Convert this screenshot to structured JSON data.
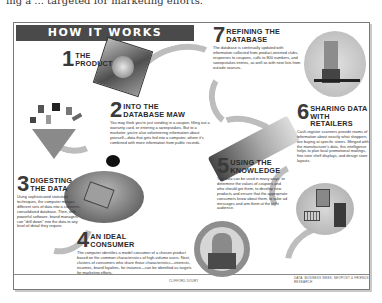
{
  "top_cutoff_text": "ing a ... targeted for marketing efforts.",
  "banner": {
    "title": "HOW IT WORKS"
  },
  "steps": [
    {
      "number": "1",
      "title_line1": "THE",
      "title_line2": "PRODUCT",
      "body": ""
    },
    {
      "number": "2",
      "title_line1": "INTO THE",
      "title_line2": "DATABASE MAW",
      "body": "You may think you're just sending in a coupon, filling out a warranty card, or entering a sweepstakes. But to a marketer, you're also volunteering information about yourself—data that gets fed into a computer, where it's combined with more information from public records."
    },
    {
      "number": "3",
      "title_line1": "DIGESTING",
      "title_line2": "THE DATA",
      "body": "Using sophisticated statistical techniques, the computer merges different sets of data into a coherent, consolidated database. Then, with powerful software, brand managers can \"drill down\" into the data to any level of detail they require."
    },
    {
      "number": "4",
      "title_line1": "AN IDEAL",
      "title_line2": "CONSUMER",
      "body": "The computer identifies a model consumer of a chosen product based on the common characteristics of high-volume users. Next, clusters of consumers who share those characteristics—interests, incomes, brand loyalties, for instance—can be identified as targets for marketing efforts."
    },
    {
      "number": "5",
      "title_line1": "USING THE",
      "title_line2": "KNOWLEDGE",
      "body": "The data can be used in many ways: to determine the values of coupons and who should get them, to develop new products and ensure that the appropriate consumers know about them, to tailor ad messages and aim them at the right audience."
    },
    {
      "number": "6",
      "title_line1": "SHARING DATA",
      "title_line2": "WITH RETAILERS",
      "body": "Cash-register scanners provide reams of information about exactly what shoppers are buying at specific stores. Merged with the manufacturer's data, this intelligence helps to plan local promotional mailings, fine-tune shelf displays, and design store layouts."
    },
    {
      "number": "7",
      "title_line1": "REFINING THE",
      "title_line2": "DATABASE",
      "body": "The database is continually updated with information collected from product-oriented clubs, responses to coupons, calls to 800 numbers, and sweepstakes entries, as well as with new lists from outside sources."
    }
  ],
  "credits": {
    "left": "CLIFFORD DOURY",
    "right": "DATA: BUSINESS WEEK; NEOPOST & FRIENDS RESEARCH"
  },
  "colors": {
    "banner_bg": "#4a4a4a",
    "banner_text": "#ffffff",
    "arrow": "#bdbdbd",
    "frame_border": "#7a7a7a"
  }
}
